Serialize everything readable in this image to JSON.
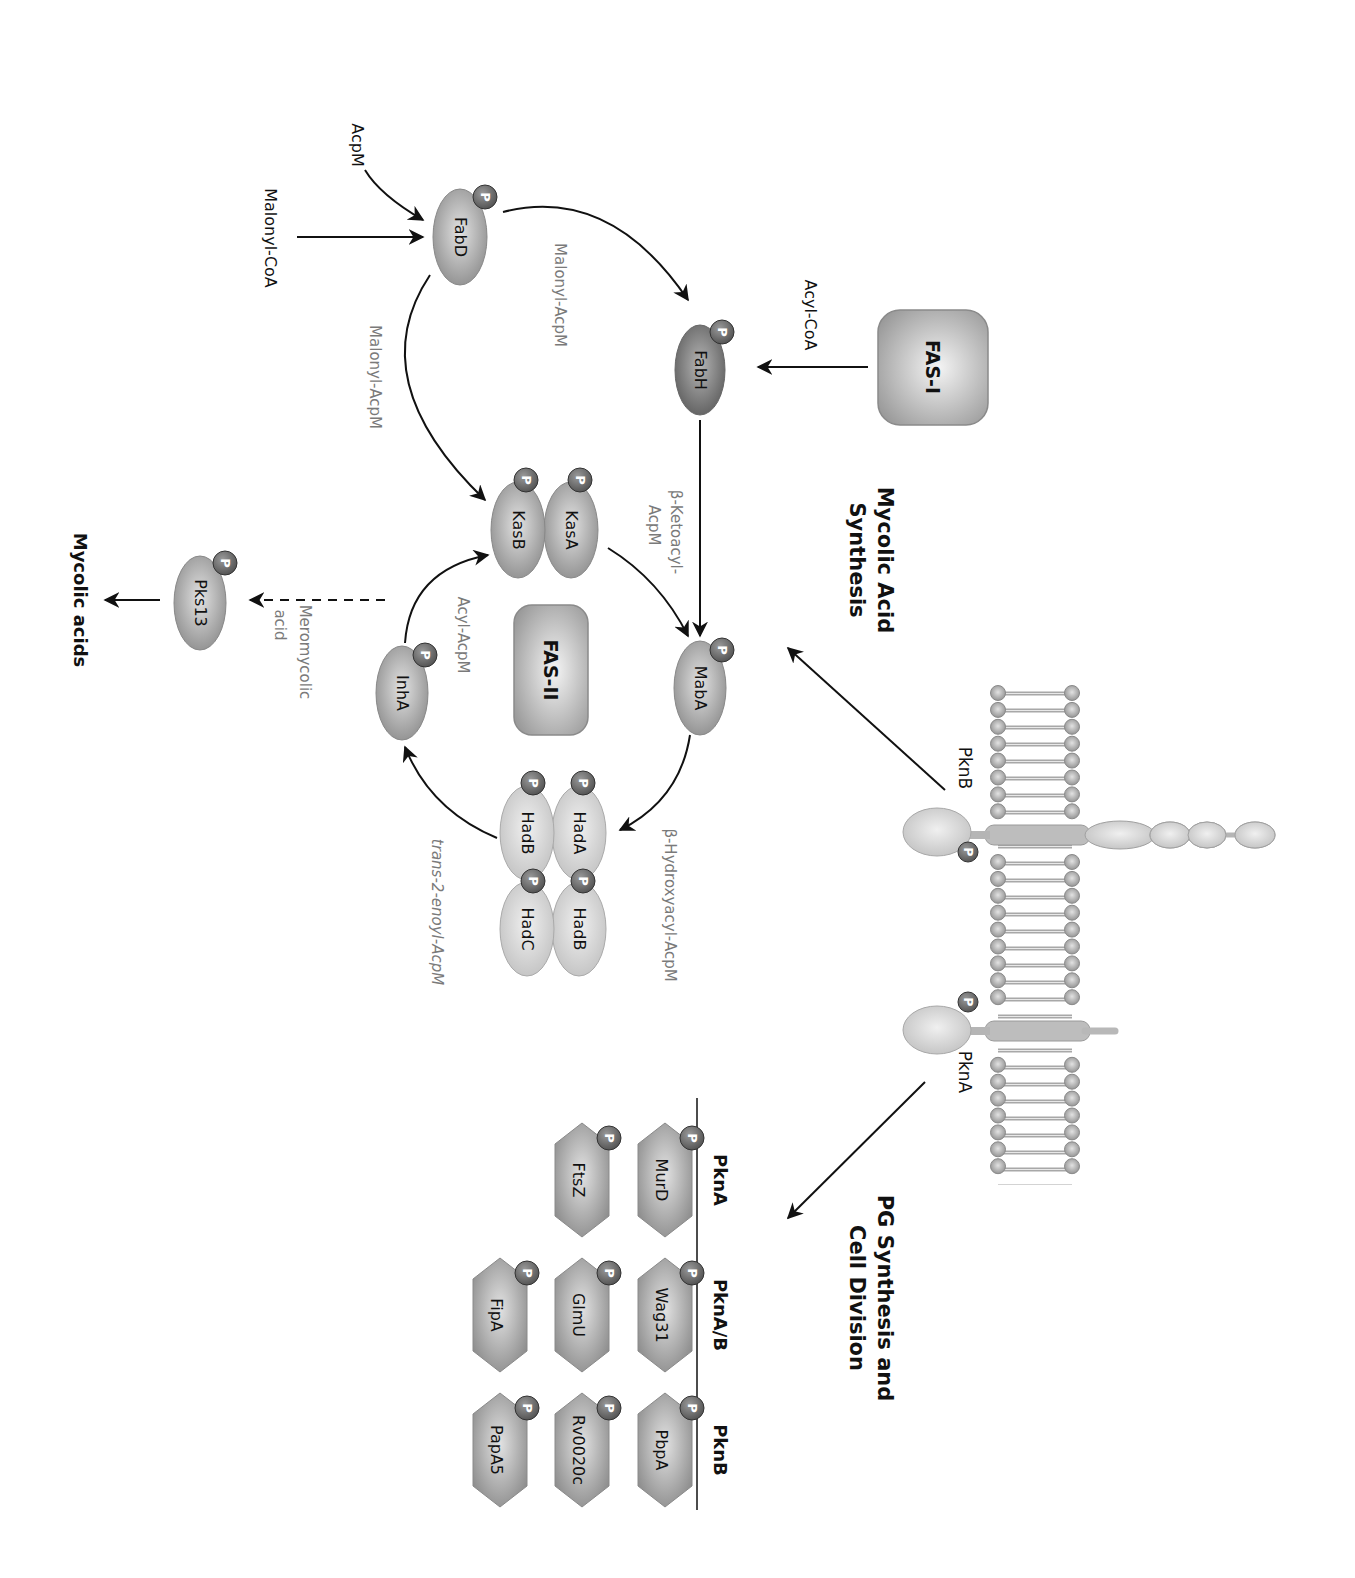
{
  "orientation": "rotated 90 degrees clockwise",
  "sections": {
    "mycolic_title": [
      "Mycolic Acid",
      "Synthesis"
    ],
    "pg_title": [
      "PG Synthesis and",
      "Cell Division"
    ]
  },
  "membrane": {
    "kinases": [
      {
        "id": "pknb",
        "label": "PknB"
      },
      {
        "id": "pkna",
        "label": "PknA"
      }
    ]
  },
  "complexes": {
    "fas1": "FAS-I",
    "fas2": "FAS-II"
  },
  "enzymes": {
    "fabd": "FabD",
    "fabh": "FabH",
    "kasa": "KasA",
    "kasb": "KasB",
    "maba": "MabA",
    "inha": "InhA",
    "hada": "HadA",
    "hadb1": "HadB",
    "hadb2": "HadB",
    "hadc": "HadC",
    "pks13": "Pks13"
  },
  "substrates": {
    "acpm": "AcpM",
    "malonyl_coa": "Malonyl-CoA",
    "acyl_coa": "Acyl-CoA",
    "malonyl_acpm_1": "Malonyl-AcpM",
    "malonyl_acpm_2": "Malonyl-AcpM",
    "ketoacyl": [
      "β-Ketoacyl-",
      "AcpM"
    ],
    "hydroxyacyl": "β-Hydroxyacyl-AcpM",
    "enoyl": "trans-2-enoyl-AcpM",
    "acyl_acpm": "Acyl-AcpM",
    "meromycolic": [
      "Meromycolic",
      "acid"
    ],
    "mycolic_acids": "Mycolic acids"
  },
  "phospho_label": "P",
  "substrate_table": {
    "columns": [
      "PknA",
      "PknA/B",
      "PknB"
    ],
    "rows": [
      [
        "MurD",
        "Wag31",
        "PbpA"
      ],
      [
        "FtsZ",
        "GlmU",
        "Rv0020c"
      ],
      [
        "",
        "FipA",
        "PapA5"
      ]
    ]
  },
  "colors": {
    "enzyme_dark": "#7d7d7d",
    "enzyme_mid": "#a6a6a6",
    "enzyme_light": "#d4d4d4",
    "phospho": "#6e6e6e",
    "arrow": "#111111",
    "grey_text": "#7a7a7a"
  }
}
